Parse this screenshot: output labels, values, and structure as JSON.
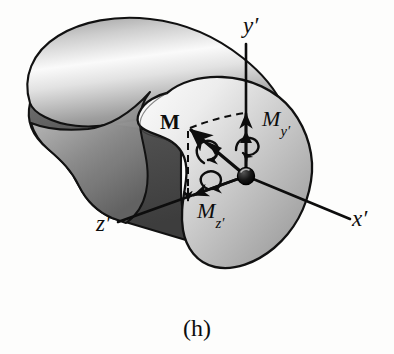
{
  "figure": {
    "caption": "(h)",
    "background_color": "#fdfdfc",
    "ink_color": "#0d0d0d"
  },
  "axes": {
    "y_prime": {
      "label": "y",
      "prime": "′",
      "orientation": "vertical-up"
    },
    "x_prime": {
      "label": "x",
      "prime": "′",
      "orientation": "down-right"
    },
    "z_prime": {
      "label": "z",
      "prime": "′",
      "orientation": "down-left"
    }
  },
  "vectors": {
    "resultant_moment": {
      "symbol": "M",
      "style": "bold",
      "kind": "double-headed-moment-arrow",
      "direction": "up-left"
    },
    "moment_y": {
      "symbol": "M",
      "subscript": "y′",
      "kind": "double-headed-moment-arrow",
      "direction": "up along y-prime"
    },
    "moment_z": {
      "symbol": "M",
      "subscript": "z′",
      "kind": "double-headed-moment-arrow",
      "direction": "down-left along z-prime"
    }
  },
  "body": {
    "shape": "curved solid bar with cut section face",
    "top_surface_color": "#f2f2f2",
    "top_surface_shadow_color": "#8f8f8f",
    "underside_color": "#4a4a4a",
    "section_face_light": "#eeeeee",
    "section_face_dark": "#9b9b9b",
    "outline_color": "#111111"
  },
  "origin": {
    "marker": "filled-sphere",
    "color": "#111111"
  }
}
